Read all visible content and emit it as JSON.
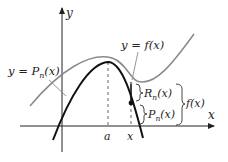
{
  "diagram": {
    "axes": {
      "x_label": "x",
      "y_label": "y"
    },
    "curves": [
      {
        "id": "f",
        "label": "y = f(x)",
        "color": "#8a8a8a"
      },
      {
        "id": "Pn",
        "label": "y = P",
        "label_sub": "n",
        "label_tail": "(x)",
        "color": "#111111"
      }
    ],
    "points": {
      "a_label": "a",
      "x_label": "x"
    },
    "brackets": {
      "remainder": {
        "main": "R",
        "sub": "n",
        "tail": "(x)"
      },
      "polynomial": {
        "main": "P",
        "sub": "n",
        "tail": "(x)"
      },
      "function": {
        "label": "f(x)"
      }
    },
    "colors": {
      "function_curve": "#8a8a8a",
      "polynomial_curve": "#111111",
      "axes": "#222222",
      "dashed": "#555555"
    }
  }
}
